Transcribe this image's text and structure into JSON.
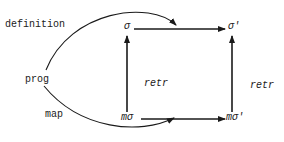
{
  "diagram": {
    "labels": {
      "definition": "definition",
      "prog": "prog",
      "map": "map",
      "sigma": "σ",
      "sigma_prime": "σ'",
      "m_sigma": "mσ",
      "m_sigma_prime": "mσ'",
      "retr_left": "retr",
      "retr_right": "retr"
    },
    "edges": [
      {
        "from": "prog",
        "to": "top-arrow",
        "label": "definition",
        "style": "curve"
      },
      {
        "from": "prog",
        "to": "bottom-arrow",
        "label": "map",
        "style": "curve"
      },
      {
        "from": "σ",
        "to": "σ'",
        "style": "arrow"
      },
      {
        "from": "mσ",
        "to": "mσ'",
        "style": "arrow"
      },
      {
        "from": "mσ",
        "to": "σ",
        "label": "retr",
        "style": "arrow"
      },
      {
        "from": "mσ'",
        "to": "σ'",
        "label": "retr",
        "style": "arrow"
      }
    ],
    "colors": {
      "ink": "#1a1a1a",
      "background": "#ffffff"
    }
  }
}
